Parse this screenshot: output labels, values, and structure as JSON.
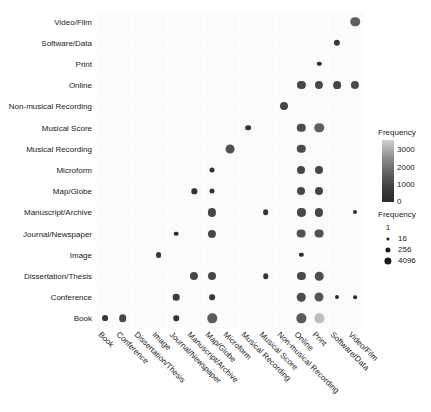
{
  "chart_data": {
    "type": "heatmap",
    "title": "",
    "xlabel": "",
    "ylabel": "",
    "grid": true,
    "legend_position": "right",
    "x_categories": [
      "Book",
      "Conference",
      "Dissertation/Thesis",
      "Image",
      "Journal/Newspaper",
      "Manuscript/Archive",
      "Map/Globe",
      "Microform",
      "Musical Recording",
      "Musical Score",
      "Non-musical Recording",
      "Online",
      "Print",
      "Software/Data",
      "Video/Film"
    ],
    "y_categories": [
      "Book",
      "Conference",
      "Dissertation/Thesis",
      "Image",
      "Journal/Newspaper",
      "Manuscript/Archive",
      "Map/Globe",
      "Microform",
      "Musical Recording",
      "Musical Score",
      "Non-musical Recording",
      "Online",
      "Print",
      "Software/Data",
      "Video/Film"
    ],
    "color_legend": {
      "title": "Frequency",
      "ticks": [
        3000,
        2000,
        1000,
        0
      ],
      "range": [
        0,
        3600
      ]
    },
    "size_legend": {
      "title": "Frequency",
      "breaks": [
        1,
        16,
        256,
        4096
      ]
    },
    "points": [
      {
        "x": "Book",
        "y": "Book",
        "size": 18,
        "value": 60
      },
      {
        "x": "Conference",
        "y": "Book",
        "size": 60,
        "value": 200
      },
      {
        "x": "Journal/Newspaper",
        "y": "Book",
        "size": 14,
        "value": 40
      },
      {
        "x": "Map/Globe",
        "y": "Book",
        "size": 220,
        "value": 500
      },
      {
        "x": "Online",
        "y": "Book",
        "size": 200,
        "value": 450
      },
      {
        "x": "Print",
        "y": "Book",
        "size": 200,
        "value": 3200
      },
      {
        "x": "Journal/Newspaper",
        "y": "Conference",
        "size": 30,
        "value": 90
      },
      {
        "x": "Map/Globe",
        "y": "Conference",
        "size": 16,
        "value": 50
      },
      {
        "x": "Online",
        "y": "Conference",
        "size": 110,
        "value": 260
      },
      {
        "x": "Print",
        "y": "Conference",
        "size": 170,
        "value": 380
      },
      {
        "x": "Software/Data",
        "y": "Conference",
        "size": 5,
        "value": 12
      },
      {
        "x": "Video/Film",
        "y": "Conference",
        "size": 4,
        "value": 10
      },
      {
        "x": "Manuscript/Archive",
        "y": "Dissertation/Thesis",
        "size": 90,
        "value": 210
      },
      {
        "x": "Map/Globe",
        "y": "Dissertation/Thesis",
        "size": 80,
        "value": 190
      },
      {
        "x": "Musical Score",
        "y": "Dissertation/Thesis",
        "size": 14,
        "value": 40
      },
      {
        "x": "Online",
        "y": "Dissertation/Thesis",
        "size": 90,
        "value": 220
      },
      {
        "x": "Print",
        "y": "Dissertation/Thesis",
        "size": 120,
        "value": 280
      },
      {
        "x": "Image",
        "y": "Image",
        "size": 18,
        "value": 55
      },
      {
        "x": "Online",
        "y": "Image",
        "size": 6,
        "value": 16
      },
      {
        "x": "Journal/Newspaper",
        "y": "Journal/Newspaper",
        "size": 8,
        "value": 20
      },
      {
        "x": "Map/Globe",
        "y": "Journal/Newspaper",
        "size": 90,
        "value": 210
      },
      {
        "x": "Online",
        "y": "Journal/Newspaper",
        "size": 140,
        "value": 320
      },
      {
        "x": "Print",
        "y": "Journal/Newspaper",
        "size": 140,
        "value": 320
      },
      {
        "x": "Map/Globe",
        "y": "Manuscript/Archive",
        "size": 90,
        "value": 210
      },
      {
        "x": "Musical Score",
        "y": "Manuscript/Archive",
        "size": 16,
        "value": 45
      },
      {
        "x": "Online",
        "y": "Manuscript/Archive",
        "size": 90,
        "value": 210
      },
      {
        "x": "Print",
        "y": "Manuscript/Archive",
        "size": 90,
        "value": 210
      },
      {
        "x": "Video/Film",
        "y": "Manuscript/Archive",
        "size": 5,
        "value": 12
      },
      {
        "x": "Manuscript/Archive",
        "y": "Map/Globe",
        "size": 12,
        "value": 35
      },
      {
        "x": "Map/Globe",
        "y": "Map/Globe",
        "size": 10,
        "value": 28
      },
      {
        "x": "Online",
        "y": "Map/Globe",
        "size": 80,
        "value": 190
      },
      {
        "x": "Print",
        "y": "Map/Globe",
        "size": 80,
        "value": 190
      },
      {
        "x": "Map/Globe",
        "y": "Microform",
        "size": 10,
        "value": 28
      },
      {
        "x": "Online",
        "y": "Microform",
        "size": 80,
        "value": 190
      },
      {
        "x": "Print",
        "y": "Microform",
        "size": 80,
        "value": 190
      },
      {
        "x": "Microform",
        "y": "Musical Recording",
        "size": 150,
        "value": 350
      },
      {
        "x": "Online",
        "y": "Musical Recording",
        "size": 110,
        "value": 260
      },
      {
        "x": "Musical Recording",
        "y": "Musical Score",
        "size": 16,
        "value": 45
      },
      {
        "x": "Online",
        "y": "Musical Score",
        "size": 110,
        "value": 260
      },
      {
        "x": "Print",
        "y": "Musical Score",
        "size": 230,
        "value": 520
      },
      {
        "x": "Non-musical Recording",
        "y": "Non-musical Recording",
        "size": 80,
        "value": 190
      },
      {
        "x": "Online",
        "y": "Online",
        "size": 90,
        "value": 210
      },
      {
        "x": "Print",
        "y": "Online",
        "size": 90,
        "value": 210
      },
      {
        "x": "Software/Data",
        "y": "Online",
        "size": 70,
        "value": 170
      },
      {
        "x": "Video/Film",
        "y": "Online",
        "size": 90,
        "value": 210
      },
      {
        "x": "Print",
        "y": "Print",
        "size": 6,
        "value": 16
      },
      {
        "x": "Software/Data",
        "y": "Software/Data",
        "size": 24,
        "value": 70
      },
      {
        "x": "Video/Film",
        "y": "Video/Film",
        "size": 230,
        "value": 520
      }
    ]
  }
}
